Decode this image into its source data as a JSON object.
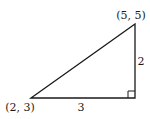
{
  "diagram": {
    "type": "right-triangle",
    "vertices": {
      "top": {
        "label": "(5, 5)"
      },
      "left": {
        "label": "(2, 3)"
      }
    },
    "sides": {
      "horizontal": {
        "label": "3"
      },
      "vertical": {
        "label": "2"
      }
    },
    "right_angle_marker": true,
    "stroke_color": "#1a1a1a"
  }
}
